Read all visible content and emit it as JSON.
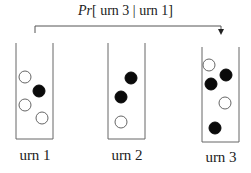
{
  "title": {
    "prefix": "Pr",
    "expression": "[ urn 3 | urn 1]"
  },
  "relation_arrow": {
    "from": "urn 1",
    "to": "urn 3"
  },
  "urns": [
    {
      "label": "urn 1",
      "balls": [
        {
          "color": "white",
          "x": 25,
          "y": 77
        },
        {
          "color": "black",
          "x": 39,
          "y": 91
        },
        {
          "color": "white",
          "x": 25,
          "y": 105
        },
        {
          "color": "white",
          "x": 42,
          "y": 118
        }
      ]
    },
    {
      "label": "urn 2",
      "balls": [
        {
          "color": "black",
          "x": 131,
          "y": 78
        },
        {
          "color": "black",
          "x": 121,
          "y": 97
        },
        {
          "color": "white",
          "x": 121,
          "y": 122
        }
      ]
    },
    {
      "label": "urn 3",
      "balls": [
        {
          "color": "white",
          "x": 209,
          "y": 65
        },
        {
          "color": "black",
          "x": 226,
          "y": 75
        },
        {
          "color": "black",
          "x": 211,
          "y": 84
        },
        {
          "color": "white",
          "x": 225,
          "y": 103
        },
        {
          "color": "black",
          "x": 215,
          "y": 128
        }
      ]
    }
  ],
  "colors": {
    "stroke": "#555555",
    "black_ball": "#0a0a0a",
    "white_ball": "#ffffff"
  }
}
